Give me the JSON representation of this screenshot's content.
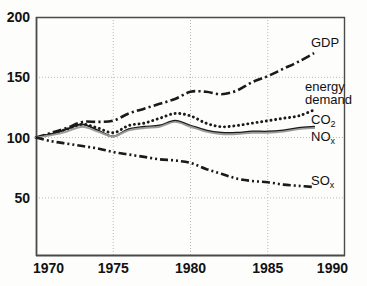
{
  "chart_data": {
    "type": "line",
    "title": "",
    "subtitle": "",
    "xlabel": "",
    "ylabel": "",
    "xlim": [
      1970,
      1990
    ],
    "ylim": [
      0,
      200
    ],
    "grid": true,
    "legend_position": "right-inline",
    "x_ticks": [
      "1970",
      "1975",
      "1980",
      "1985",
      "1990"
    ],
    "x_tick_values": [
      1970,
      1975,
      1980,
      1985,
      1990
    ],
    "y_ticks": [
      "50",
      "100",
      "150",
      "200"
    ],
    "y_tick_values": [
      50,
      100,
      150,
      200
    ],
    "x": [
      1970,
      1971,
      1972,
      1973,
      1974,
      1975,
      1976,
      1977,
      1978,
      1979,
      1980,
      1981,
      1982,
      1983,
      1984,
      1985,
      1986,
      1987,
      1988
    ],
    "series": [
      {
        "name": "GDP",
        "label": "GDP",
        "style": "dash-dot",
        "color": "#1a1a1a",
        "values": [
          100,
          104,
          108,
          113,
          113,
          114,
          120,
          124,
          128,
          132,
          138,
          138,
          136,
          139,
          146,
          151,
          157,
          163,
          170
        ]
      },
      {
        "name": "energy demand",
        "label": "energy demand",
        "label_line1": "energy",
        "label_line2": "demand",
        "style": "dotted",
        "color": "#1a1a1a",
        "values": [
          100,
          103,
          107,
          111,
          108,
          104,
          110,
          112,
          116,
          120,
          118,
          112,
          109,
          110,
          112,
          114,
          116,
          118,
          123
        ]
      },
      {
        "name": "CO2",
        "label": "CO",
        "label_sub": "2",
        "style": "solid",
        "color": "#1a1a1a",
        "values": [
          100,
          103,
          107,
          111,
          106,
          101,
          107,
          109,
          110,
          114,
          110,
          106,
          104,
          104,
          105,
          105,
          106,
          108,
          109
        ]
      },
      {
        "name": "NOx",
        "label": "NO",
        "label_sub": "x",
        "style": "solid-gray",
        "color": "#9a9a9a",
        "values": [
          100,
          102,
          105,
          109,
          105,
          101,
          106,
          108,
          109,
          113,
          109,
          105,
          103,
          103,
          104,
          104,
          105,
          107,
          108
        ]
      },
      {
        "name": "SOx",
        "label": "SO",
        "label_sub": "x",
        "style": "dash-dot-dot",
        "color": "#1a1a1a",
        "values": [
          100,
          97,
          95,
          93,
          91,
          88,
          86,
          84,
          82,
          81,
          79,
          74,
          70,
          66,
          64,
          63,
          61,
          60,
          59
        ]
      }
    ]
  },
  "annotations": {
    "gdp_label": "GDP",
    "energy_line1": "energy",
    "energy_line2": "demand",
    "co2_label": "CO",
    "co2_sub": "2",
    "nox_label": "NO",
    "nox_sub": "x",
    "sox_label": "SO",
    "sox_sub": "x"
  },
  "colors": {
    "axis": "#555555",
    "grid": "#b9b9b9",
    "ink": "#1a1a1a",
    "gray_series": "#9a9a9a",
    "background": "#fdfdfc"
  }
}
